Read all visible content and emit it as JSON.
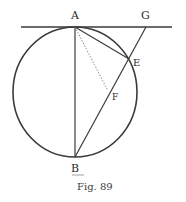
{
  "figure": {
    "caption": "Fig. 89",
    "ink_color": "#3a3a3a",
    "points": {
      "A": {
        "label": "A",
        "x": 75,
        "y": 27
      },
      "B": {
        "label": "B",
        "x": 75,
        "y": 157
      },
      "E": {
        "label": "E",
        "x": 129,
        "y": 59
      },
      "F": {
        "label": "F",
        "x": 108,
        "y": 91
      },
      "G": {
        "label": "G",
        "x": 146,
        "y": 27
      }
    },
    "circle": {
      "cx": 75,
      "cy": 92,
      "rx": 62,
      "ry": 65
    },
    "segments": [
      {
        "name": "tangent-line",
        "from": "left-end",
        "to": "right-end",
        "style": "solid"
      },
      {
        "name": "diameter-AB",
        "from": "A",
        "to": "B",
        "style": "solid"
      },
      {
        "name": "chord-AE",
        "from": "A",
        "to": "E",
        "style": "solid"
      },
      {
        "name": "secant-GB",
        "from": "G",
        "to": "B",
        "style": "solid"
      },
      {
        "name": "perpendicular-AF",
        "from": "A",
        "to": "F",
        "style": "dotted"
      }
    ]
  }
}
